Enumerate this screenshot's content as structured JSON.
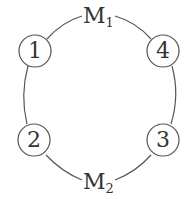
{
  "diagram": {
    "nodes": [
      {
        "id": "1",
        "label": "1"
      },
      {
        "id": "2",
        "label": "2"
      },
      {
        "id": "3",
        "label": "3"
      },
      {
        "id": "4",
        "label": "4"
      }
    ],
    "top_label": {
      "main": "M",
      "sub": "1"
    },
    "bottom_label": {
      "main": "M",
      "sub": "2"
    },
    "line_color": "#555555"
  }
}
